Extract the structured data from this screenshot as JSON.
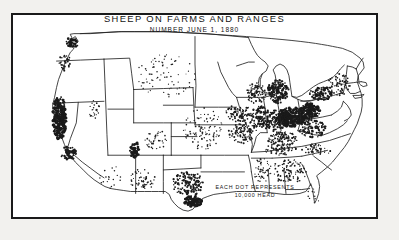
{
  "figure": {
    "title": "SHEEP ON FARMS AND RANGES",
    "subtitle": "NUMBER JUNE 1, 1880",
    "frame_color": "#1a1a1a",
    "background_color": "#ffffff",
    "page_background_color": "#f2f1ee",
    "dot_color": "#1a1a1a",
    "outline_color": "#222222"
  },
  "legend": {
    "line1": "EACH DOT REPRESENTS",
    "line2": "10,000 HEAD"
  },
  "chart_data": {
    "type": "scatter",
    "title": "SHEEP ON FARMS AND RANGES",
    "subtitle": "NUMBER JUNE 1, 1880",
    "xlabel": "",
    "ylabel": "",
    "map_projection": "conterminous-united-states",
    "dot_value": 10000,
    "dot_unit": "head of sheep",
    "legend_text": "EACH DOT REPRESENTS 10,000 HEAD",
    "grid": false,
    "legend_position": "bottom-center",
    "density_regions": [
      {
        "name": "Ohio",
        "cx": 281,
        "cy": 104,
        "rx": 14,
        "ry": 10,
        "density": 1.0,
        "dot_size": 1.5
      },
      {
        "name": "Western Pennsylvania",
        "cx": 300,
        "cy": 98,
        "rx": 11,
        "ry": 8,
        "density": 0.92,
        "dot_size": 1.4
      },
      {
        "name": "Michigan Lower Peninsula",
        "cx": 268,
        "cy": 78,
        "rx": 11,
        "ry": 12,
        "density": 0.7,
        "dot_size": 1.2
      },
      {
        "name": "Western New York",
        "cx": 312,
        "cy": 80,
        "rx": 12,
        "ry": 7,
        "density": 0.62,
        "dot_size": 1.2
      },
      {
        "name": "Indiana",
        "cx": 266,
        "cy": 108,
        "rx": 10,
        "ry": 11,
        "density": 0.58,
        "dot_size": 1.1
      },
      {
        "name": "Illinois",
        "cx": 250,
        "cy": 106,
        "rx": 11,
        "ry": 13,
        "density": 0.5,
        "dot_size": 1.1
      },
      {
        "name": "Kentucky",
        "cx": 272,
        "cy": 126,
        "rx": 16,
        "ry": 7,
        "density": 0.48,
        "dot_size": 1.0
      },
      {
        "name": "West Virginia / Virginia",
        "cx": 303,
        "cy": 116,
        "rx": 14,
        "ry": 9,
        "density": 0.52,
        "dot_size": 1.1
      },
      {
        "name": "Wisconsin",
        "cx": 246,
        "cy": 80,
        "rx": 10,
        "ry": 11,
        "density": 0.42,
        "dot_size": 1.0
      },
      {
        "name": "Iowa",
        "cx": 228,
        "cy": 100,
        "rx": 13,
        "ry": 9,
        "density": 0.38,
        "dot_size": 1.0
      },
      {
        "name": "Missouri",
        "cx": 231,
        "cy": 120,
        "rx": 13,
        "ry": 11,
        "density": 0.36,
        "dot_size": 1.0
      },
      {
        "name": "Tennessee",
        "cx": 271,
        "cy": 137,
        "rx": 17,
        "ry": 6,
        "density": 0.34,
        "dot_size": 0.95
      },
      {
        "name": "North Carolina",
        "cx": 307,
        "cy": 137,
        "rx": 16,
        "ry": 6,
        "density": 0.3,
        "dot_size": 0.95
      },
      {
        "name": "Georgia / Alabama",
        "cx": 279,
        "cy": 160,
        "rx": 18,
        "ry": 13,
        "density": 0.26,
        "dot_size": 0.9
      },
      {
        "name": "Mississippi",
        "cx": 252,
        "cy": 158,
        "rx": 9,
        "ry": 13,
        "density": 0.24,
        "dot_size": 0.9
      },
      {
        "name": "New England",
        "cx": 330,
        "cy": 70,
        "rx": 12,
        "ry": 12,
        "density": 0.3,
        "dot_size": 0.95
      },
      {
        "name": "South Texas coast",
        "cx": 182,
        "cy": 190,
        "rx": 9,
        "ry": 6,
        "density": 0.95,
        "dot_size": 1.5
      },
      {
        "name": "Central Texas",
        "cx": 177,
        "cy": 172,
        "rx": 16,
        "ry": 13,
        "density": 0.4,
        "dot_size": 1.1
      },
      {
        "name": "California Central Valley",
        "cx": 47,
        "cy": 105,
        "rx": 7,
        "ry": 22,
        "density": 0.9,
        "dot_size": 1.5
      },
      {
        "name": "Southern California",
        "cx": 56,
        "cy": 141,
        "rx": 8,
        "ry": 7,
        "density": 0.62,
        "dot_size": 1.3
      },
      {
        "name": "Puget Sound",
        "cx": 60,
        "cy": 28,
        "rx": 7,
        "ry": 5,
        "density": 0.72,
        "dot_size": 1.3
      },
      {
        "name": "Willamette Valley",
        "cx": 52,
        "cy": 48,
        "rx": 6,
        "ry": 9,
        "density": 0.34,
        "dot_size": 1.0
      },
      {
        "name": "Utah Wasatch Front",
        "cx": 123,
        "cy": 138,
        "rx": 5,
        "ry": 9,
        "density": 0.8,
        "dot_size": 1.4
      },
      {
        "name": "Western Nevada",
        "cx": 82,
        "cy": 96,
        "rx": 6,
        "ry": 10,
        "density": 0.22,
        "dot_size": 0.9
      },
      {
        "name": "New Mexico",
        "cx": 131,
        "cy": 168,
        "rx": 13,
        "ry": 11,
        "density": 0.22,
        "dot_size": 0.9
      },
      {
        "name": "Colorado",
        "cx": 146,
        "cy": 128,
        "rx": 14,
        "ry": 10,
        "density": 0.18,
        "dot_size": 0.85
      },
      {
        "name": "Great Plains",
        "cx": 192,
        "cy": 116,
        "rx": 20,
        "ry": 22,
        "density": 0.14,
        "dot_size": 0.85
      },
      {
        "name": "Dakotas / Montana",
        "cx": 155,
        "cy": 62,
        "rx": 30,
        "ry": 22,
        "density": 0.07,
        "dot_size": 0.8
      },
      {
        "name": "Florida",
        "cx": 305,
        "cy": 182,
        "rx": 7,
        "ry": 12,
        "density": 0.07,
        "dot_size": 0.8
      },
      {
        "name": "Arizona",
        "cx": 98,
        "cy": 165,
        "rx": 12,
        "ry": 12,
        "density": 0.08,
        "dot_size": 0.8
      }
    ]
  }
}
